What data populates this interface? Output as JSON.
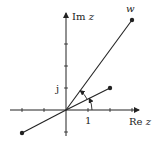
{
  "diagram": {
    "type": "complex-plane",
    "labels": {
      "imag_axis": "Im",
      "imag_var": "z",
      "real_axis": "Re",
      "real_var": "z",
      "unit_real": "1",
      "unit_imag": "j",
      "point_w": "w"
    },
    "colors": {
      "stroke": "#222222",
      "background": "#ffffff"
    },
    "points": [
      {
        "name": "z",
        "x": 2,
        "y": 1
      },
      {
        "name": "w",
        "x": 3,
        "y": 4
      },
      {
        "name": "-z",
        "x": -2,
        "y": -1
      }
    ]
  }
}
